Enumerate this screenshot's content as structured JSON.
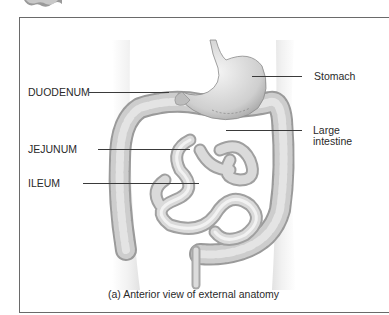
{
  "figure": {
    "caption": "(a) Anterior view of external anatomy",
    "labels": {
      "stomach": "Stomach",
      "duodenum": "DUODENUM",
      "large_intestine_line1": "Large",
      "large_intestine_line2": "intestine",
      "jejunum": "JEJUNUM",
      "ileum": "ILEUM"
    }
  }
}
